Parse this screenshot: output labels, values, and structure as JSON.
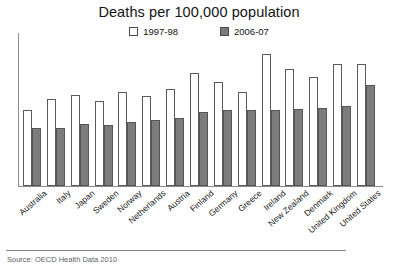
{
  "chart_data": {
    "type": "bar",
    "title": "Deaths per 100,000 population",
    "xlabel": "",
    "ylabel": "",
    "grid": false,
    "legend_position": "top-center",
    "axis_ticks_visible": false,
    "ylim": [
      0,
      170
    ],
    "categories": [
      "Australia",
      "Italy",
      "Japan",
      "Sweden",
      "Norway",
      "Netherlands",
      "Austria",
      "Finland",
      "Germany",
      "Greece",
      "Ireland",
      "New Zealand",
      "Denmark",
      "United Kingdom",
      "United States"
    ],
    "series": [
      {
        "name": "1997-98",
        "color": "#ffffff",
        "edge_color": "#5a5a5a",
        "values": [
          84,
          97,
          101,
          94,
          104,
          100,
          108,
          125,
          116,
          104,
          147,
          130,
          121,
          136,
          135
        ]
      },
      {
        "name": "2006-07",
        "color": "#7c7c7c",
        "edge_color": "#555555",
        "values": [
          64,
          65,
          69,
          68,
          71,
          73,
          75,
          82,
          84,
          84,
          84,
          86,
          87,
          89,
          112
        ]
      }
    ]
  },
  "legend": {
    "entries": [
      {
        "label": "1997-98",
        "swatch": "series-light"
      },
      {
        "label": "2006-07",
        "swatch": "series-dark"
      }
    ]
  },
  "footer": {
    "source_note": "Source: OECD Health Data 2010"
  }
}
